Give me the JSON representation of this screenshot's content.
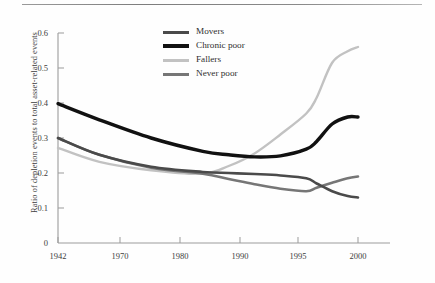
{
  "figure": {
    "top_rule": "horizontal-rule"
  },
  "axes": {
    "ylabel": "Ratio of depletion events to total asset-related events",
    "xlabel": "",
    "ytick_labels": [
      "0.6",
      "0.5",
      "0.4",
      "0.3",
      "0.2",
      "0.1",
      "0"
    ],
    "xtick_labels": [
      "1942",
      "1970",
      "1980",
      "1990",
      "1995",
      "2000"
    ]
  },
  "legend": {
    "position": "top-center",
    "entries": [
      {
        "label": "Movers",
        "color": "#4a4a4a",
        "width": 2.6
      },
      {
        "label": "Chronic poor",
        "color": "#111111",
        "width": 3.4
      },
      {
        "label": "Fallers",
        "color": "#c2c2c2",
        "width": 2.4
      },
      {
        "label": "Never poor",
        "color": "#767676",
        "width": 2.6
      }
    ]
  },
  "chart_data": {
    "type": "line",
    "title": "",
    "xlabel": "",
    "ylabel": "Ratio of depletion events to total asset-related events",
    "xlim": [
      1942,
      2000
    ],
    "ylim": [
      0,
      0.6
    ],
    "grid": false,
    "legend_position": "top-center",
    "xticks": [
      1942,
      1970,
      1980,
      1990,
      1995,
      2000
    ],
    "yticks": [
      0,
      0.1,
      0.2,
      0.3,
      0.4,
      0.5,
      0.6
    ],
    "x": [
      1942,
      1950,
      1960,
      1970,
      1975,
      1980,
      1985,
      1990,
      1992,
      1995,
      1998,
      2000
    ],
    "series": [
      {
        "name": "Movers",
        "color": "#4a4a4a",
        "values": [
          0.3,
          0.252,
          0.218,
          0.203,
          0.2,
          0.197,
          0.193,
          0.185,
          0.17,
          0.148,
          0.134,
          0.13
        ]
      },
      {
        "name": "Chronic poor",
        "color": "#111111",
        "values": [
          0.398,
          0.352,
          0.3,
          0.262,
          0.252,
          0.246,
          0.249,
          0.268,
          0.29,
          0.34,
          0.36,
          0.36
        ]
      },
      {
        "name": "Fallers",
        "color": "#c2c2c2",
        "values": [
          0.272,
          0.232,
          0.208,
          0.198,
          0.22,
          0.256,
          0.31,
          0.37,
          0.415,
          0.515,
          0.548,
          0.56
        ]
      },
      {
        "name": "Never poor",
        "color": "#767676",
        "values": [
          0.3,
          0.252,
          0.215,
          0.198,
          0.183,
          0.168,
          0.155,
          0.148,
          0.158,
          0.172,
          0.185,
          0.19
        ]
      }
    ]
  }
}
